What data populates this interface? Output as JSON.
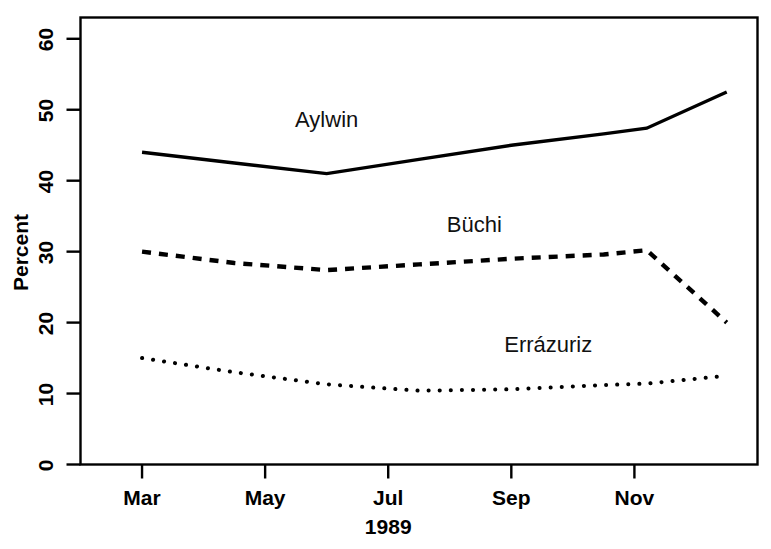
{
  "chart_data": {
    "type": "line",
    "title": "",
    "subtitle": "",
    "xlabel": "1989",
    "ylabel": "Percent",
    "xlim": [
      2.0,
      13.0
    ],
    "ylim": [
      0,
      63
    ],
    "grid": false,
    "legend_position": "inline-annotations",
    "x_tick_positions": [
      3,
      5,
      7,
      9,
      11
    ],
    "x_tick_labels": [
      "Mar",
      "May",
      "Jul",
      "Sep",
      "Nov"
    ],
    "y_ticks": [
      0,
      10,
      20,
      30,
      40,
      50,
      60
    ],
    "y_tick_labels": [
      "0",
      "10",
      "20",
      "30",
      "40",
      "50",
      "60"
    ],
    "x": [
      3.0,
      4.5,
      6.0,
      7.5,
      9.0,
      10.5,
      11.2,
      12.5
    ],
    "series": [
      {
        "name": "Aylwin",
        "style": "solid",
        "label_x": 6.0,
        "label_y": 48.5,
        "values": [
          44.0,
          42.5,
          41.0,
          43.0,
          45.0,
          46.6,
          47.4,
          52.5
        ]
      },
      {
        "name": "Büchi",
        "style": "dashed",
        "label_x": 8.4,
        "label_y": 33.8,
        "values": [
          30.0,
          28.4,
          27.4,
          28.2,
          29.0,
          29.6,
          30.2,
          20.0
        ]
      },
      {
        "name": "Errázuriz",
        "style": "dotted",
        "label_x": 9.6,
        "label_y": 16.9,
        "values": [
          15.0,
          13.0,
          11.3,
          10.4,
          10.6,
          11.2,
          11.4,
          12.5
        ]
      }
    ],
    "colors": {
      "axis": "#000000",
      "aylwin": "#000000",
      "buchi": "#000000",
      "errazuriz": "#000000",
      "background": "#ffffff"
    }
  }
}
